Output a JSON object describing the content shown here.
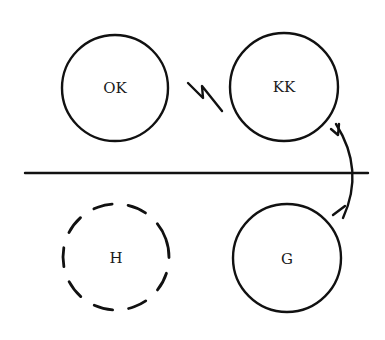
{
  "diagram": {
    "background": "#ffffff",
    "ink_color": "#111111",
    "nodes": [
      {
        "id": "OK",
        "label": "OK",
        "cx": 115,
        "cy": 88,
        "r": 53,
        "style": "solid",
        "region": "above-line"
      },
      {
        "id": "KK",
        "label": "KK",
        "cx": 284,
        "cy": 87,
        "r": 54,
        "style": "solid",
        "region": "above-line"
      },
      {
        "id": "H",
        "label": "H",
        "cx": 116,
        "cy": 257,
        "r": 53,
        "style": "dashed",
        "region": "below-line"
      },
      {
        "id": "G",
        "label": "G",
        "cx": 287,
        "cy": 258,
        "r": 54,
        "style": "solid",
        "region": "below-line"
      }
    ],
    "divider": {
      "type": "horizontal-line",
      "x1": 25,
      "x2": 368,
      "y": 173
    },
    "connectors": [
      {
        "type": "lightning-bolt",
        "between": [
          "OK",
          "KK"
        ],
        "meaning": "conflict"
      },
      {
        "type": "curved-arrow",
        "from": "KK",
        "to": "G",
        "crosses": "divider",
        "arrowheads": 2
      }
    ]
  }
}
